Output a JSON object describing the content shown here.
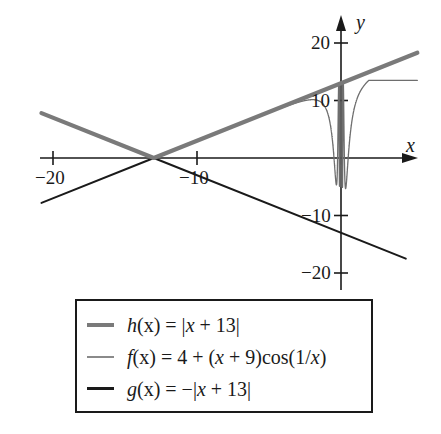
{
  "chart_data": {
    "type": "line",
    "title": "",
    "xlabel": "x",
    "ylabel": "y",
    "xlim": [
      -21,
      5.4
    ],
    "ylim": [
      -22,
      24
    ],
    "grid": false,
    "legend_position": "bottom",
    "x_ticks": [
      -20,
      -10
    ],
    "x_tick_labels": [
      "−20",
      "−10"
    ],
    "y_ticks": [
      20,
      10,
      -10,
      -20
    ],
    "y_tick_labels": [
      "20",
      "10",
      "−10",
      "−20"
    ],
    "series": [
      {
        "name": "h(x) = |x + 13|",
        "formula": "abs(x+13)",
        "style": "thick gray",
        "color": "#7a7a7a",
        "x_range": [
          -20.8,
          5.3
        ],
        "points": [
          [
            -20.8,
            7.8
          ],
          [
            -13,
            0
          ],
          [
            0,
            13
          ],
          [
            5.3,
            18.3
          ]
        ]
      },
      {
        "name": "f(x) = 4 + (x + 9)cos(1/x)",
        "formula": "4+(x+9)*cos(1/x)",
        "style": "thin gray",
        "color": "#6e6e6e",
        "x_range": [
          -4.5,
          5.3
        ],
        "points": [
          [
            -4.5,
            8.4
          ],
          [
            -3,
            10.1
          ],
          [
            -1,
            2.6
          ],
          [
            -0.5,
            -1.3
          ],
          [
            0.5,
            -1.6
          ],
          [
            1,
            9.4
          ],
          [
            3,
            16.2
          ],
          [
            5.3,
            17.9
          ]
        ]
      },
      {
        "name": "g(x) = −|x + 13|",
        "formula": "-abs(x+13)",
        "style": "medium black",
        "color": "#1a1a1a",
        "x_range": [
          -20.8,
          4.5
        ],
        "points": [
          [
            -20.8,
            -7.8
          ],
          [
            -13,
            0
          ],
          [
            0,
            -13
          ],
          [
            4.5,
            -17.5
          ]
        ]
      }
    ]
  },
  "legend": {
    "items": [
      {
        "fn": "h",
        "arg": "(x)",
        "eq": " = |",
        "var": "x",
        "rest": " + 13|"
      },
      {
        "fn": "f",
        "arg": "(x)",
        "eq": " = 4 + (",
        "var": "x",
        "rest": " + 9)cos(1/",
        "var2": "x",
        "rest2": ")"
      },
      {
        "fn": "g",
        "arg": "(x)",
        "eq": " = −|",
        "var": "x",
        "rest": " + 13|"
      }
    ]
  }
}
